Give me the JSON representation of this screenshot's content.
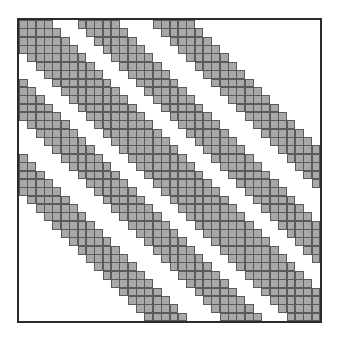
{
  "chart_data": {
    "type": "heatmap",
    "title": "",
    "n": 36,
    "bands": [
      {
        "min_offset": 0,
        "max_offset": 3
      },
      {
        "min_offset": 7,
        "max_offset": 11
      },
      {
        "min_offset": 16,
        "max_offset": 20
      }
    ],
    "symmetric": true,
    "xlabel": "",
    "ylabel": "",
    "grid": true
  },
  "colors": {
    "fill": "#a8a8a8",
    "cell_border": "#5a5a5a",
    "frame": "#2b2b2b",
    "background": "#ffffff"
  }
}
